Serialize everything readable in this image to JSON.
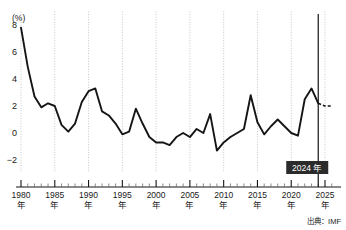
{
  "chart_data": {
    "type": "line",
    "title": "",
    "xlabel": "年",
    "ylabel": "(%)",
    "unit_label": "(%)",
    "ylim": [
      -3,
      9
    ],
    "xlim": [
      1980,
      2026
    ],
    "yticks": [
      8,
      6,
      4,
      2,
      0,
      -2
    ],
    "ytick_labels": [
      "8",
      "6",
      "4",
      "2",
      "0",
      "−2"
    ],
    "xticks": [
      1980,
      1985,
      1990,
      1995,
      2000,
      2005,
      2010,
      2015,
      2020,
      2025
    ],
    "xtick_labels": [
      "1980",
      "1985",
      "1990",
      "1995",
      "2000",
      "2005",
      "2010",
      "2015",
      "2020",
      "2025"
    ],
    "xtick_suffix": "年",
    "grid": "vertical-dotted-at-major-xticks",
    "legend": "none",
    "source": "出典：IMF",
    "annotation": {
      "label": "2024 年",
      "year": 2024,
      "style": "white-text-on-dark-box",
      "marker": "vertical-solid-line"
    },
    "series": [
      {
        "name": "実績",
        "style": "solid",
        "x": [
          1980,
          1981,
          1982,
          1983,
          1984,
          1985,
          1986,
          1987,
          1988,
          1989,
          1990,
          1991,
          1992,
          1993,
          1994,
          1995,
          1996,
          1997,
          1998,
          1999,
          2000,
          2001,
          2002,
          2003,
          2004,
          2005,
          2006,
          2007,
          2008,
          2009,
          2010,
          2011,
          2012,
          2013,
          2014,
          2015,
          2016,
          2017,
          2018,
          2019,
          2020,
          2021,
          2022,
          2023,
          2024
        ],
        "values": [
          7.8,
          4.9,
          2.7,
          1.9,
          2.2,
          2.0,
          0.6,
          0.1,
          0.7,
          2.3,
          3.1,
          3.3,
          1.6,
          1.3,
          0.7,
          -0.1,
          0.1,
          1.8,
          0.7,
          -0.3,
          -0.7,
          -0.7,
          -0.9,
          -0.3,
          0.0,
          -0.3,
          0.3,
          0.0,
          1.4,
          -1.3,
          -0.7,
          -0.3,
          0.0,
          0.3,
          2.8,
          0.8,
          -0.1,
          0.5,
          1.0,
          0.5,
          0.0,
          -0.2,
          2.5,
          3.3,
          2.2
        ]
      },
      {
        "name": "予測",
        "style": "dashed",
        "x": [
          2024,
          2025,
          2026
        ],
        "values": [
          2.2,
          2.0,
          2.0
        ]
      }
    ]
  },
  "chart": {
    "unit": "(%)",
    "source": "出典：IMF",
    "callout": "2024 年",
    "year_suffix": "年"
  }
}
